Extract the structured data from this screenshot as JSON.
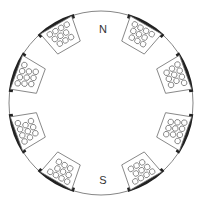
{
  "diagram": {
    "labels": {
      "north": "N",
      "south": "S"
    },
    "slot_count": 8,
    "conductors_per_slot": 10,
    "colors": {
      "outline": "#555555",
      "pole": "#222222",
      "background": "#ffffff"
    }
  }
}
